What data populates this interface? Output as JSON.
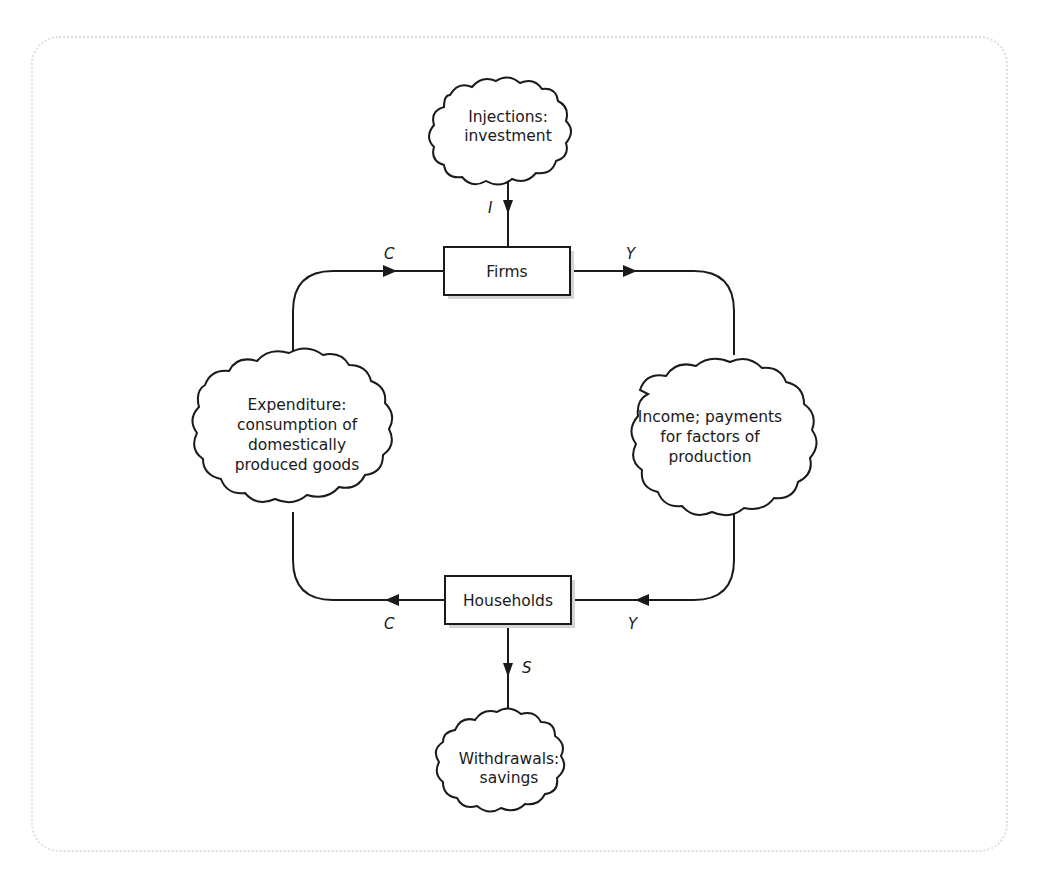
{
  "diagram": {
    "nodes": {
      "injections": {
        "lines": [
          "Injections:",
          "investment"
        ]
      },
      "firms": {
        "label": "Firms"
      },
      "expenditure": {
        "lines": [
          "Expenditure:",
          "consumption of",
          "domestically",
          "produced goods"
        ]
      },
      "income": {
        "lines": [
          "Income; payments",
          "for factors of",
          "production"
        ]
      },
      "households": {
        "label": "Households"
      },
      "withdrawals": {
        "lines": [
          "Withdrawals:",
          "savings"
        ]
      }
    },
    "flows": {
      "investment": "I",
      "consumption_top": "C",
      "income_top": "Y",
      "consumption_bottom": "C",
      "income_bottom": "Y",
      "savings": "S"
    },
    "colors": {
      "stroke": "#1a1a1a",
      "frame": "#dedede",
      "background": "#ffffff"
    }
  }
}
